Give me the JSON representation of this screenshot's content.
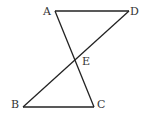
{
  "diagram": {
    "points": {
      "A": {
        "label": "A"
      },
      "B": {
        "label": "B"
      },
      "C": {
        "label": "C"
      },
      "D": {
        "label": "D"
      },
      "E": {
        "label": "E"
      }
    },
    "segments": [
      {
        "from": "A",
        "to": "D"
      },
      {
        "from": "A",
        "to": "C"
      },
      {
        "from": "D",
        "to": "B"
      },
      {
        "from": "B",
        "to": "C"
      }
    ],
    "intersection": {
      "point": "E",
      "of": [
        "AC",
        "BD"
      ]
    },
    "line_color": "#222222",
    "label_color": "#333333"
  }
}
